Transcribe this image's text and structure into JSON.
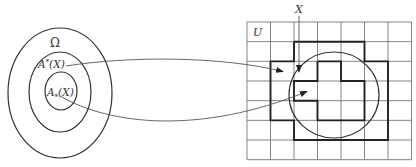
{
  "left_diagram": {
    "universe_label": "Ω",
    "upper_label": {
      "base": "A",
      "mark": "*",
      "arg": "(X)"
    },
    "lower_label": {
      "base": "A",
      "mark": "*",
      "arg": "(X)"
    }
  },
  "right_diagram": {
    "universe_label": "U",
    "set_label": "X",
    "grid": {
      "columns": 7,
      "rows": 7
    },
    "upper_approximation_cells": [
      [
        2,
        1
      ],
      [
        3,
        1
      ],
      [
        4,
        1
      ],
      [
        1,
        2
      ],
      [
        2,
        2
      ],
      [
        3,
        2
      ],
      [
        4,
        2
      ],
      [
        5,
        2
      ],
      [
        1,
        3
      ],
      [
        2,
        3
      ],
      [
        3,
        3
      ],
      [
        4,
        3
      ],
      [
        5,
        3
      ],
      [
        1,
        4
      ],
      [
        2,
        4
      ],
      [
        3,
        4
      ],
      [
        4,
        4
      ],
      [
        5,
        4
      ],
      [
        2,
        5
      ],
      [
        3,
        5
      ],
      [
        4,
        5
      ],
      [
        5,
        5
      ]
    ],
    "lower_approximation_cells": [
      [
        3,
        2
      ],
      [
        2,
        3
      ],
      [
        3,
        3
      ],
      [
        4,
        3
      ],
      [
        3,
        4
      ],
      [
        4,
        4
      ]
    ]
  },
  "arrows": [
    {
      "from": "upper_label",
      "to": "upper_approximation"
    },
    {
      "from": "lower_label",
      "to": "lower_approximation"
    }
  ]
}
